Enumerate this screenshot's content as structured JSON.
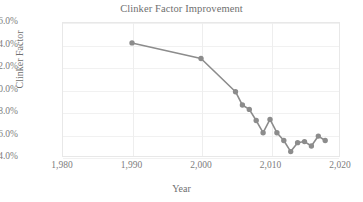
{
  "chart_data": {
    "type": "line",
    "title": "Clinker Factor Improvement",
    "xlabel": "Year",
    "ylabel": "Clinker Factor",
    "xlim": [
      1980,
      2020
    ],
    "ylim": [
      74.0,
      86.0
    ],
    "grid": true,
    "legend": false,
    "legend_position": "none",
    "marker": "circle",
    "series_color": "#8c8c8c",
    "gridline_color": "#f1f1f1",
    "axis_text_color": "#7d7d7d",
    "title_color": "#6f6f6f",
    "x_tick_labels": [
      "1,980",
      "1,990",
      "2,000",
      "2,010",
      "2,020"
    ],
    "x_ticks": [
      1980,
      1990,
      2000,
      2010,
      2020
    ],
    "y_tick_labels": [
      "86.0%",
      "84.0%",
      "82.0%",
      "80.0%",
      "78.0%",
      "76.0%",
      "74.0%"
    ],
    "y_ticks": [
      86.0,
      84.0,
      82.0,
      80.0,
      78.0,
      76.0,
      74.0
    ],
    "x": [
      1990,
      2000,
      2005,
      2006,
      2007,
      2008,
      2009,
      2010,
      2011,
      2012,
      2013,
      2014,
      2015,
      2016,
      2017,
      2018
    ],
    "values": [
      84.2,
      82.8,
      79.8,
      78.6,
      78.2,
      77.2,
      76.1,
      77.3,
      76.1,
      75.4,
      74.4,
      75.2,
      75.3,
      74.9,
      75.8,
      75.4
    ],
    "points": [
      {
        "x": 1990,
        "y": 84.2
      },
      {
        "x": 2000,
        "y": 82.8
      },
      {
        "x": 2005,
        "y": 79.8
      },
      {
        "x": 2006,
        "y": 78.6
      },
      {
        "x": 2007,
        "y": 78.2
      },
      {
        "x": 2008,
        "y": 77.2
      },
      {
        "x": 2009,
        "y": 76.1
      },
      {
        "x": 2010,
        "y": 77.3
      },
      {
        "x": 2011,
        "y": 76.1
      },
      {
        "x": 2012,
        "y": 75.4
      },
      {
        "x": 2013,
        "y": 74.4
      },
      {
        "x": 2014,
        "y": 75.2
      },
      {
        "x": 2015,
        "y": 75.3
      },
      {
        "x": 2016,
        "y": 74.9
      },
      {
        "x": 2017,
        "y": 75.8
      },
      {
        "x": 2018,
        "y": 75.4
      }
    ]
  }
}
